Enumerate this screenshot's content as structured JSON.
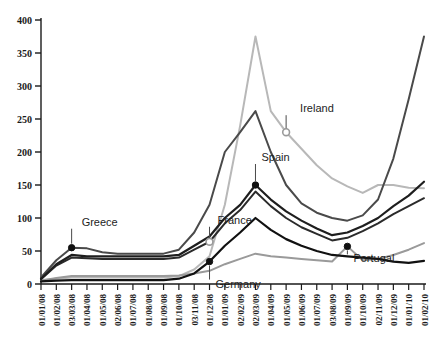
{
  "chart_data": {
    "type": "line",
    "title": "",
    "subtitle": "",
    "xlabel": "",
    "ylabel": "",
    "ylim": [
      0,
      400
    ],
    "y_ticks": [
      0,
      50,
      100,
      150,
      200,
      250,
      300,
      350,
      400
    ],
    "grid": false,
    "legend_position": "inline-annotations",
    "categories": [
      "01/01/08",
      "01/02/08",
      "03/03/08",
      "01/04/08",
      "01/05/08",
      "02/06/08",
      "01/07/08",
      "01/08/08",
      "01/09/08",
      "01/10/08",
      "03/11/08",
      "01/12/08",
      "01/01/09",
      "02/02/09",
      "02/03/09",
      "01/04/09",
      "01/05/09",
      "01/06/09",
      "01/07/09",
      "03/08/09",
      "01/09/09",
      "01/10/09",
      "02/11/09",
      "01/12/09",
      "01/01/10",
      "01/02/10"
    ],
    "series": [
      {
        "name": "Ireland",
        "color": "#b8b8b8",
        "width": 2.0,
        "marker_index": 16,
        "marker_style": "open",
        "label_anchor": "left",
        "label_dx": 14,
        "label_dy": -20,
        "values": [
          6,
          8,
          10,
          10,
          10,
          10,
          10,
          10,
          10,
          12,
          22,
          42,
          120,
          240,
          375,
          262,
          230,
          205,
          180,
          160,
          148,
          138,
          150,
          150,
          146,
          145
        ]
      },
      {
        "name": "Greece",
        "color": "#4a4a4a",
        "width": 2.0,
        "marker_index": 2,
        "marker_style": "filled",
        "label_anchor": "left",
        "label_dx": 10,
        "label_dy": -22,
        "values": [
          10,
          36,
          55,
          54,
          48,
          46,
          46,
          46,
          46,
          52,
          78,
          120,
          200,
          230,
          262,
          200,
          150,
          122,
          108,
          100,
          96,
          104,
          128,
          190,
          280,
          375
        ]
      },
      {
        "name": "Spain",
        "color": "#1e1e1e",
        "width": 2.2,
        "marker_index": 14,
        "marker_style": "filled",
        "label_anchor": "center",
        "label_dx": 6,
        "label_dy": -24,
        "values": [
          8,
          30,
          44,
          42,
          42,
          42,
          42,
          42,
          42,
          44,
          58,
          72,
          100,
          120,
          150,
          128,
          110,
          96,
          84,
          74,
          78,
          88,
          100,
          118,
          134,
          155
        ]
      },
      {
        "name": "France",
        "color": "#2b2b2b",
        "width": 2.0,
        "marker_index": 11,
        "marker_style": "open",
        "label_anchor": "left",
        "label_dx": 8,
        "label_dy": -18,
        "values": [
          7,
          28,
          40,
          39,
          38,
          38,
          38,
          38,
          38,
          40,
          52,
          64,
          92,
          112,
          140,
          118,
          100,
          86,
          76,
          66,
          70,
          80,
          92,
          106,
          118,
          130
        ]
      },
      {
        "name": "Germany",
        "color": "#111111",
        "width": 2.2,
        "marker_index": 11,
        "marker_style": "filled",
        "label_anchor": "center",
        "label_dx": 6,
        "label_dy": 26,
        "values": [
          4,
          5,
          6,
          6,
          6,
          6,
          6,
          6,
          6,
          8,
          16,
          34,
          58,
          78,
          100,
          82,
          68,
          58,
          50,
          44,
          42,
          40,
          38,
          34,
          32,
          35
        ]
      },
      {
        "name": "Portugal",
        "color": "#9a9a9a",
        "width": 2.0,
        "marker_index": 20,
        "marker_style": "filled",
        "label_anchor": "left",
        "label_dx": 6,
        "label_dy": 16,
        "values": [
          5,
          9,
          12,
          12,
          12,
          12,
          12,
          12,
          12,
          13,
          16,
          20,
          30,
          38,
          46,
          42,
          40,
          38,
          36,
          34,
          57,
          36,
          38,
          44,
          52,
          62
        ]
      }
    ]
  },
  "axes": {
    "y_tick_labels": [
      "0",
      "50",
      "100",
      "150",
      "200",
      "250",
      "300",
      "350",
      "400"
    ],
    "x_tick_labels": [
      "01/01/08",
      "01/02/08",
      "03/03/08",
      "01/04/08",
      "01/05/08",
      "02/06/08",
      "01/07/08",
      "01/08/08",
      "01/09/08",
      "01/10/08",
      "03/11/08",
      "01/12/08",
      "01/01/09",
      "02/02/09",
      "02/03/09",
      "01/04/09",
      "01/05/09",
      "01/06/09",
      "01/07/09",
      "03/08/09",
      "01/09/09",
      "01/10/09",
      "02/11/09",
      "01/12/09",
      "01/01/10",
      "01/02/10"
    ],
    "axis_color": "#1a1a1a"
  },
  "annotations": [
    {
      "text": "Greece"
    },
    {
      "text": "Ireland"
    },
    {
      "text": "Spain"
    },
    {
      "text": "France"
    },
    {
      "text": "Germany"
    },
    {
      "text": "Portugal"
    }
  ]
}
